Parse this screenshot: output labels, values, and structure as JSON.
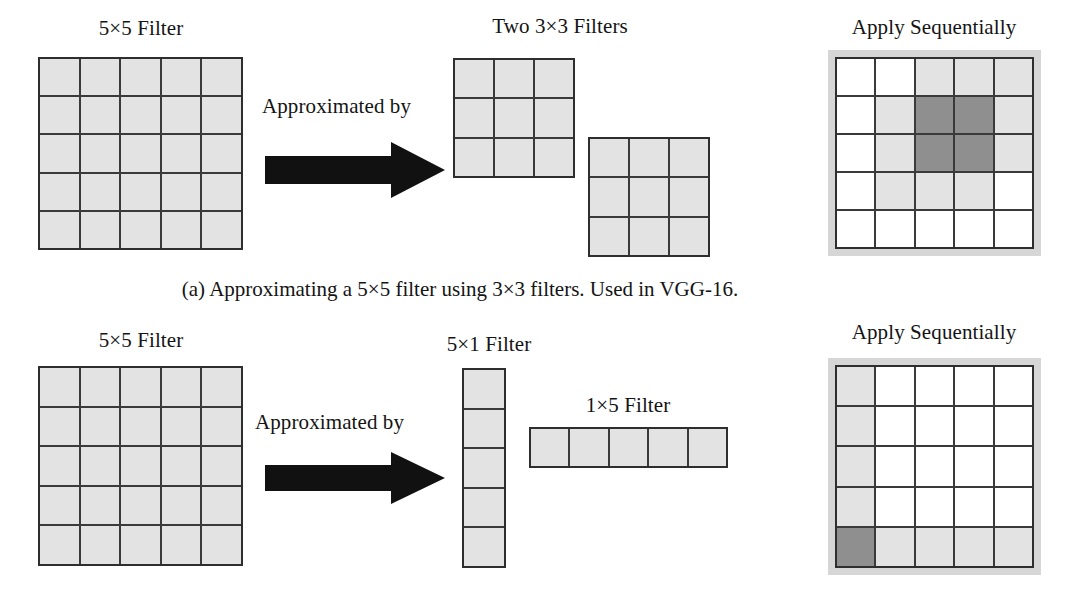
{
  "figure": {
    "domain": "diagram",
    "background": "#ffffff",
    "colors": {
      "cell_light": "#e3e3e3",
      "cell_dark": "#8f8f8f",
      "cell_white": "#ffffff",
      "grid_line": "#3a3a3a",
      "frame": "#d6d6d6",
      "arrow": "#111111",
      "text": "#141414"
    }
  },
  "panel_a": {
    "caption": "(a) Approximating a 5×5 filter using 3×3 filters. Used in VGG-16.",
    "source_label": "5×5 Filter",
    "relation_label": "Approximated by",
    "target_label": "Two 3×3 Filters",
    "result_label": "Apply Sequentially",
    "source_grid": {
      "rows": 5,
      "cols": 5,
      "cells": [
        [
          "light",
          "light",
          "light",
          "light",
          "light"
        ],
        [
          "light",
          "light",
          "light",
          "light",
          "light"
        ],
        [
          "light",
          "light",
          "light",
          "light",
          "light"
        ],
        [
          "light",
          "light",
          "light",
          "light",
          "light"
        ],
        [
          "light",
          "light",
          "light",
          "light",
          "light"
        ]
      ]
    },
    "filter_one": {
      "rows": 3,
      "cols": 3,
      "cells": [
        [
          "light",
          "light",
          "light"
        ],
        [
          "light",
          "light",
          "light"
        ],
        [
          "light",
          "light",
          "light"
        ]
      ]
    },
    "filter_two": {
      "rows": 3,
      "cols": 3,
      "cells": [
        [
          "light",
          "light",
          "light"
        ],
        [
          "light",
          "light",
          "light"
        ],
        [
          "light",
          "light",
          "light"
        ]
      ]
    },
    "result_grid": {
      "rows": 5,
      "cols": 5,
      "cells": [
        [
          "white",
          "white",
          "light",
          "light",
          "light"
        ],
        [
          "white",
          "light",
          "dark",
          "dark",
          "light"
        ],
        [
          "white",
          "light",
          "dark",
          "dark",
          "light"
        ],
        [
          "white",
          "light",
          "light",
          "light",
          "white"
        ],
        [
          "white",
          "white",
          "white",
          "white",
          "white"
        ]
      ]
    }
  },
  "panel_b": {
    "source_label": "5×5 Filter",
    "relation_label": "Approximated by",
    "filter_v_label": "5×1 Filter",
    "filter_h_label": "1×5 Filter",
    "result_label": "Apply Sequentially",
    "source_grid": {
      "rows": 5,
      "cols": 5,
      "cells": [
        [
          "light",
          "light",
          "light",
          "light",
          "light"
        ],
        [
          "light",
          "light",
          "light",
          "light",
          "light"
        ],
        [
          "light",
          "light",
          "light",
          "light",
          "light"
        ],
        [
          "light",
          "light",
          "light",
          "light",
          "light"
        ],
        [
          "light",
          "light",
          "light",
          "light",
          "light"
        ]
      ]
    },
    "filter_v": {
      "rows": 5,
      "cols": 1,
      "cells": [
        [
          "light"
        ],
        [
          "light"
        ],
        [
          "light"
        ],
        [
          "light"
        ],
        [
          "light"
        ]
      ]
    },
    "filter_h": {
      "rows": 1,
      "cols": 5,
      "cells": [
        [
          "light",
          "light",
          "light",
          "light",
          "light"
        ]
      ]
    },
    "result_grid": {
      "rows": 5,
      "cols": 5,
      "cells": [
        [
          "light",
          "white",
          "white",
          "white",
          "white"
        ],
        [
          "light",
          "white",
          "white",
          "white",
          "white"
        ],
        [
          "light",
          "white",
          "white",
          "white",
          "white"
        ],
        [
          "light",
          "white",
          "white",
          "white",
          "white"
        ],
        [
          "dark",
          "light",
          "light",
          "light",
          "light"
        ]
      ]
    }
  }
}
